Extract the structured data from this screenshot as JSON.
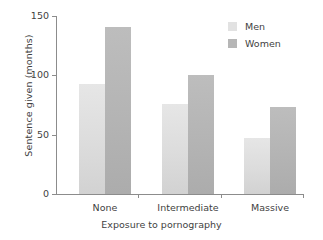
{
  "chart_data": {
    "type": "bar",
    "title": "",
    "xlabel": "Exposure to pornography",
    "ylabel": "Sentence given (months)",
    "categories": [
      "None",
      "Intermediate",
      "Massive"
    ],
    "series": [
      {
        "name": "Men",
        "values": [
          93,
          76,
          47
        ],
        "color": "#dcdcdc"
      },
      {
        "name": "Women",
        "values": [
          141,
          100,
          73
        ],
        "color": "#b4b4b4"
      }
    ],
    "ylim": [
      0,
      150
    ],
    "yticks": [
      0,
      50,
      100,
      150
    ],
    "ytick_labels": [
      "0",
      "50",
      "100",
      "150"
    ],
    "grid": false,
    "legend_position": "top-right",
    "legend_entries": [
      "Men",
      "Women"
    ]
  },
  "axes": {
    "y_label": "Sentence given (months)",
    "x_label": "Exposure to pornography",
    "y_tick_0": "0",
    "y_tick_1": "50",
    "y_tick_2": "100",
    "y_tick_3": "150",
    "x_cat_0": "None",
    "x_cat_1": "Intermediate",
    "x_cat_2": "Massive"
  },
  "legend": {
    "men_label": "Men",
    "women_label": "Women"
  }
}
